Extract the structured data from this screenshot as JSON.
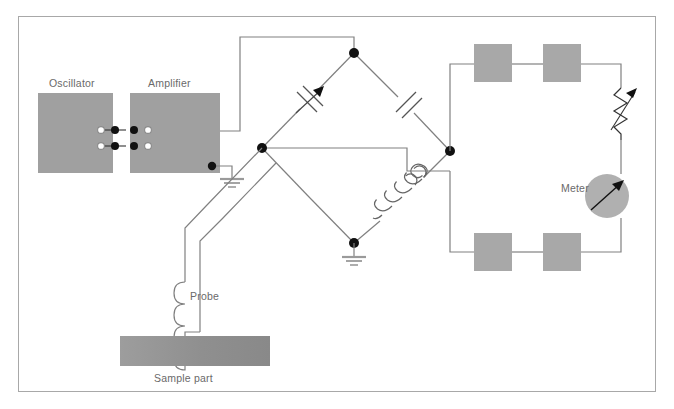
{
  "figure": {
    "border_color": "#a8a8a8",
    "background": "#ffffff",
    "wire_color": "#808080",
    "block_fill": "#a0a0a0",
    "node_color": "#111111",
    "label_color": "#6a6a6a"
  },
  "labels": {
    "oscillator": "Oscillator",
    "amplifier": "Amplifier",
    "probe": "Probe",
    "sample_part": "Sample part",
    "meter": "Meter"
  },
  "blocks": {
    "oscillator": {
      "x": 38,
      "y": 93,
      "w": 75,
      "h": 80,
      "fill": "#a0a0a0"
    },
    "amplifier": {
      "x": 130,
      "y": 93,
      "w": 90,
      "h": 80,
      "fill": "#a0a0a0"
    },
    "sample_part": {
      "x": 120,
      "y": 336,
      "w": 150,
      "h": 30,
      "fill_left": "#9a9a9a",
      "fill_right": "#8e8e8e"
    },
    "resistor_top_left": {
      "x": 474,
      "y": 44,
      "w": 38,
      "h": 38,
      "fill": "#a8a8a8"
    },
    "resistor_top_right": {
      "x": 543,
      "y": 44,
      "w": 38,
      "h": 38,
      "fill": "#a8a8a8"
    },
    "resistor_bottom_left": {
      "x": 474,
      "y": 233,
      "w": 38,
      "h": 38,
      "fill": "#a8a8a8"
    },
    "resistor_bottom_right": {
      "x": 543,
      "y": 233,
      "w": 38,
      "h": 38,
      "fill": "#a8a8a8"
    }
  },
  "components": {
    "variable_capacitor": {
      "branch": "bridge-top-left",
      "type": "variable-capacitor",
      "has_arrow": true
    },
    "fixed_capacitor": {
      "branch": "bridge-top-right",
      "type": "capacitor",
      "has_arrow": false
    },
    "bridge_coil": {
      "branch": "bridge-bottom-right",
      "type": "inductor",
      "turns": 5
    },
    "probe_coil": {
      "type": "inductor",
      "turns": 4
    },
    "variable_resistor": {
      "type": "variable-resistor",
      "has_arrow": true,
      "zigzag_peaks": 5
    },
    "meter": {
      "type": "analog-meter",
      "cx": 607,
      "cy": 196,
      "r": 22,
      "needle_angle_deg": -40
    },
    "ground_amplifier": {
      "type": "ground",
      "bars": 3
    },
    "ground_bridge": {
      "type": "ground",
      "bars": 3
    }
  },
  "bridge_nodes": {
    "top": {
      "x": 354,
      "y": 53
    },
    "left": {
      "x": 262,
      "y": 148
    },
    "right": {
      "x": 450,
      "y": 151
    },
    "bottom": {
      "x": 354,
      "y": 243
    }
  },
  "terminals": {
    "rows": 2,
    "open_circles_per_row": 2,
    "filled_dots_per_row": 2
  }
}
